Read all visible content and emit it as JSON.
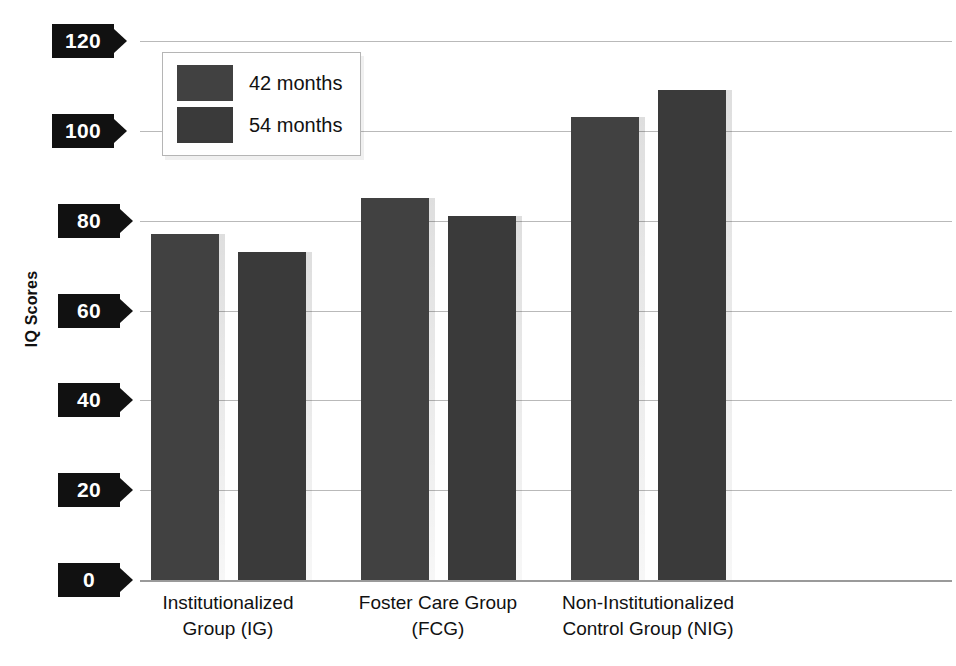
{
  "chart_data": {
    "type": "bar",
    "title": "",
    "xlabel": "",
    "ylabel": "IQ Scores",
    "ylim": [
      0,
      120
    ],
    "yticks": [
      0,
      20,
      40,
      60,
      80,
      100,
      120
    ],
    "grid": true,
    "legend_position": "top-left-inside",
    "categories": [
      "Institutionalized\nGroup (IG)",
      "Foster Care Group\n(FCG)",
      "Non-Institutionalized\nControl Group (NIG)"
    ],
    "category_lines": [
      [
        "Institutionalized",
        "Group (IG)"
      ],
      [
        "Foster Care Group",
        "(FCG)"
      ],
      [
        "Non-Institutionalized",
        "Control Group (NIG)"
      ]
    ],
    "series": [
      {
        "name": "42 months",
        "color": "#414141",
        "values": [
          77,
          85,
          103
        ]
      },
      {
        "name": "54 months",
        "color": "#3a3a3a",
        "values": [
          73,
          81,
          109
        ]
      }
    ]
  },
  "legend": {
    "items": [
      {
        "label": "42 months"
      },
      {
        "label": "54 months"
      }
    ]
  },
  "axis": {
    "y_title": "IQ Scores",
    "ticks": [
      "120",
      "100",
      "80",
      "60",
      "40",
      "20",
      "0"
    ]
  },
  "title_sliver": ""
}
